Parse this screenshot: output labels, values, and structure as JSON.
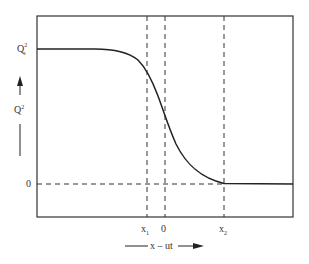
{
  "diagram": {
    "y_axis": {
      "label": "Q",
      "label_sup": "2",
      "top_tick": "Q",
      "top_tick_sup": "2",
      "top_tick_sub": "s",
      "zero_tick": "0"
    },
    "x_axis": {
      "label": "x – ut",
      "ticks": [
        {
          "label": "x",
          "sub": "1"
        },
        {
          "label": "0",
          "sub": ""
        },
        {
          "label": "x",
          "sub": "2"
        }
      ]
    },
    "colors": {
      "line": "#222222",
      "frame": "#333333"
    }
  }
}
